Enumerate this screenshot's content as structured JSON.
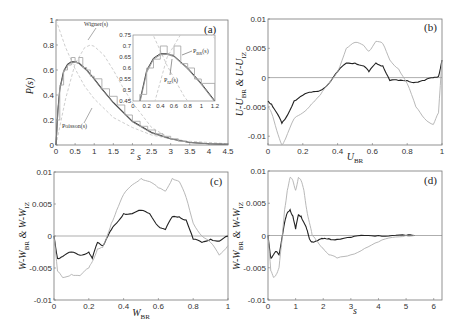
{
  "chart_data": [
    {
      "id": "a",
      "type": "line",
      "panel_label": "(a)",
      "xlabel": "s",
      "ylabel": "P(s)",
      "xlim": [
        0,
        4.5
      ],
      "ylim": [
        0,
        1
      ],
      "xticks": [
        "0",
        "0.5",
        "1",
        "1.5",
        "2",
        "2.5",
        "3",
        "3.5",
        "4",
        "4.5"
      ],
      "yticks": [
        "0",
        "0.2",
        "0.4",
        "0.6",
        "0.8",
        "1"
      ],
      "grid": false,
      "annotations": [
        "Wigner(s)",
        "Poisson(s)"
      ],
      "series": [
        {
          "name": "Poisson(s)",
          "color": "#c8c8c8",
          "style": "dashed",
          "x": [
            0,
            0.25,
            0.5,
            0.75,
            1,
            1.5,
            2,
            2.5,
            3,
            3.5,
            4,
            4.5
          ],
          "y": [
            1,
            0.78,
            0.61,
            0.47,
            0.37,
            0.22,
            0.14,
            0.08,
            0.05,
            0.03,
            0.02,
            0.01
          ]
        },
        {
          "name": "Wigner(s)",
          "color": "#c8c8c8",
          "style": "dashed",
          "x": [
            0,
            0.25,
            0.5,
            0.75,
            0.9,
            1,
            1.25,
            1.5,
            1.75,
            2,
            2.5,
            3
          ],
          "y": [
            0,
            0.37,
            0.65,
            0.78,
            0.8,
            0.79,
            0.72,
            0.6,
            0.46,
            0.34,
            0.14,
            0.05
          ]
        },
        {
          "name": "P_BR(s)",
          "color": "#333333",
          "style": "solid",
          "x": [
            0,
            0.05,
            0.1,
            0.2,
            0.3,
            0.4,
            0.5,
            0.6,
            0.8,
            1,
            1.2,
            1.5,
            2,
            2.5,
            3,
            3.5,
            4,
            4.5
          ],
          "y": [
            0,
            0.28,
            0.45,
            0.59,
            0.645,
            0.665,
            0.665,
            0.655,
            0.6,
            0.53,
            0.45,
            0.34,
            0.19,
            0.1,
            0.05,
            0.02,
            0.01,
            0.005
          ]
        },
        {
          "name": "P_IZ(s)",
          "color": "#888888",
          "style": "solid",
          "x": [
            0,
            0.05,
            0.1,
            0.2,
            0.3,
            0.4,
            0.5,
            0.6,
            0.8,
            1,
            1.2,
            1.5,
            2,
            2.5,
            3,
            3.5,
            4,
            4.5
          ],
          "y": [
            0,
            0.27,
            0.44,
            0.58,
            0.64,
            0.66,
            0.662,
            0.652,
            0.595,
            0.525,
            0.445,
            0.335,
            0.185,
            0.095,
            0.048,
            0.02,
            0.01,
            0.004
          ]
        },
        {
          "name": "histogram",
          "color": "#aaaaaa",
          "style": "steps",
          "x": [
            0,
            0.1,
            0.2,
            0.3,
            0.4,
            0.5,
            0.6,
            0.7,
            0.8,
            0.9,
            1,
            1.2,
            1.4,
            1.6,
            1.8,
            2,
            2.2,
            2.4,
            2.6,
            2.8,
            3,
            3.2,
            3.4
          ],
          "y": [
            0.2,
            0.48,
            0.6,
            0.64,
            0.7,
            0.66,
            0.7,
            0.62,
            0.6,
            0.55,
            0.53,
            0.45,
            0.39,
            0.32,
            0.24,
            0.19,
            0.15,
            0.12,
            0.09,
            0.07,
            0.05,
            0.03,
            0.02
          ]
        }
      ],
      "inset": {
        "xlim": [
          0,
          1.2
        ],
        "ylim": [
          0.45,
          0.75
        ],
        "xticks": [
          "0",
          "0.2",
          "0.4",
          "0.6",
          "0.8",
          "1",
          "1.2"
        ],
        "yticks": [
          "0.45",
          "0.5",
          "0.55",
          "0.6",
          "0.65",
          "0.7",
          "0.75"
        ],
        "annotations": [
          "P_BR(s)",
          "P_IZ(s)"
        ]
      }
    },
    {
      "id": "b",
      "type": "line",
      "panel_label": "(b)",
      "xlabel": "U_BR",
      "ylabel": "U-U_BR & U-U_IZ",
      "xlim": [
        0,
        1
      ],
      "ylim": [
        -0.0115,
        0.01
      ],
      "xticks": [
        "0",
        "0.2",
        "0.4",
        "0.6",
        "0.8",
        "1"
      ],
      "yticks": [
        "-0.01",
        "-0.005",
        "0",
        "0.005",
        "0.01"
      ],
      "grid": false,
      "series": [
        {
          "name": "U-U_BR",
          "color": "#222222",
          "x": [
            0,
            0.02,
            0.05,
            0.08,
            0.1,
            0.15,
            0.2,
            0.25,
            0.3,
            0.35,
            0.4,
            0.45,
            0.5,
            0.55,
            0.58,
            0.62,
            0.66,
            0.7,
            0.75,
            0.8,
            0.85,
            0.9,
            0.95,
            0.98,
            1
          ],
          "y": [
            -0.004,
            -0.0045,
            -0.006,
            -0.0078,
            -0.007,
            -0.004,
            -0.003,
            -0.0025,
            -0.0022,
            -0.001,
            0.001,
            0.0025,
            0.0025,
            0.002,
            0.001,
            0.0025,
            0.002,
            -0.0005,
            -0.0005,
            -0.0005,
            -0.0008,
            -0.0005,
            0,
            0.0002,
            0.003
          ]
        },
        {
          "name": "U-U_IZ",
          "color": "#b0b0b0",
          "x": [
            0,
            0.02,
            0.05,
            0.08,
            0.1,
            0.15,
            0.2,
            0.25,
            0.3,
            0.35,
            0.4,
            0.45,
            0.5,
            0.55,
            0.58,
            0.62,
            0.66,
            0.7,
            0.75,
            0.8,
            0.85,
            0.9,
            0.95,
            0.98,
            1
          ],
          "y": [
            -0.005,
            -0.006,
            -0.009,
            -0.0115,
            -0.0105,
            -0.007,
            -0.006,
            -0.0045,
            -0.003,
            -0.001,
            0.001,
            0.005,
            0.006,
            0.0055,
            0.0045,
            0.0062,
            0.0058,
            0.003,
            0.0015,
            -0.001,
            -0.005,
            -0.007,
            -0.008,
            -0.006,
            0.003
          ]
        }
      ]
    },
    {
      "id": "c",
      "type": "line",
      "panel_label": "(c)",
      "xlabel": "W_BR",
      "ylabel": "W-W_BR & W-W_IZ",
      "xlim": [
        0,
        1
      ],
      "ylim": [
        -0.01,
        0.01
      ],
      "xticks": [
        "0",
        "0.2",
        "0.4",
        "0.6",
        "0.8",
        "1"
      ],
      "yticks": [
        "-0.01",
        "-0.005",
        "0",
        "0.005",
        "0.01"
      ],
      "grid": false,
      "series": [
        {
          "name": "W-W_BR",
          "color": "#222222",
          "x": [
            0,
            0.02,
            0.05,
            0.1,
            0.15,
            0.2,
            0.22,
            0.25,
            0.28,
            0.3,
            0.33,
            0.36,
            0.4,
            0.45,
            0.5,
            0.55,
            0.6,
            0.64,
            0.68,
            0.72,
            0.76,
            0.8,
            0.85,
            0.9,
            0.95,
            1
          ],
          "y": [
            0,
            -0.0035,
            -0.0032,
            -0.0025,
            -0.003,
            -0.0025,
            -0.0035,
            -0.001,
            -0.0015,
            -0.0005,
            0.001,
            0.002,
            0.0035,
            0.0035,
            0.004,
            0.0035,
            0.0015,
            0.001,
            0.003,
            0.003,
            0.0025,
            -0.0005,
            -0.001,
            -0.0005,
            -0.0008,
            0
          ]
        },
        {
          "name": "W-W_IZ",
          "color": "#b0b0b0",
          "x": [
            0,
            0.02,
            0.05,
            0.1,
            0.15,
            0.2,
            0.22,
            0.25,
            0.28,
            0.3,
            0.33,
            0.36,
            0.4,
            0.45,
            0.5,
            0.55,
            0.6,
            0.64,
            0.68,
            0.72,
            0.76,
            0.8,
            0.85,
            0.9,
            0.95,
            1
          ],
          "y": [
            0,
            -0.0055,
            -0.0065,
            -0.006,
            -0.0062,
            -0.005,
            -0.004,
            -0.002,
            -0.0018,
            -0.0005,
            0.002,
            0.004,
            0.0065,
            0.008,
            0.009,
            0.0085,
            0.0075,
            0.007,
            0.009,
            0.0085,
            0.006,
            0.002,
            0,
            -0.001,
            -0.003,
            -0.0015
          ]
        }
      ]
    },
    {
      "id": "d",
      "type": "line",
      "panel_label": "(d)",
      "xlabel": "s",
      "ylabel": "W-W_BR & W-W_IZ",
      "xlim": [
        0,
        6.3
      ],
      "ylim": [
        -0.01,
        0.01
      ],
      "xticks": [
        "0",
        "1",
        "2",
        "3",
        "4",
        "5",
        "6"
      ],
      "yticks": [
        "-0.01",
        "-0.005",
        "0",
        "0.005",
        "0.01"
      ],
      "grid": false,
      "series": [
        {
          "name": "W-W_BR",
          "color": "#222222",
          "x": [
            0,
            0.1,
            0.2,
            0.3,
            0.4,
            0.5,
            0.6,
            0.7,
            0.8,
            0.9,
            1,
            1.1,
            1.2,
            1.3,
            1.4,
            1.5,
            1.6,
            1.8,
            2,
            2.2,
            2.5,
            3,
            3.5,
            4,
            4.5,
            5,
            5.3
          ],
          "y": [
            0,
            -0.0035,
            -0.003,
            -0.0025,
            -0.003,
            -0.0005,
            0.002,
            0.0035,
            0.004,
            0.003,
            0.001,
            0.0032,
            0.003,
            0.002,
            0.001,
            -0.0005,
            -0.001,
            -0.0008,
            -0.0005,
            -0.0005,
            -0.0006,
            -0.0003,
            0,
            0,
            0,
            0,
            0
          ]
        },
        {
          "name": "W-W_IZ",
          "color": "#b0b0b0",
          "x": [
            0,
            0.1,
            0.2,
            0.3,
            0.4,
            0.5,
            0.6,
            0.7,
            0.8,
            0.9,
            1,
            1.1,
            1.2,
            1.3,
            1.4,
            1.5,
            1.6,
            1.8,
            2,
            2.2,
            2.5,
            3,
            3.5,
            4,
            4.5,
            5,
            5.3
          ],
          "y": [
            0,
            -0.0055,
            -0.0065,
            -0.006,
            -0.005,
            -0.001,
            0.004,
            0.007,
            0.009,
            0.0085,
            0.007,
            0.009,
            0.0085,
            0.007,
            0.004,
            0.002,
            0,
            -0.001,
            -0.002,
            -0.003,
            -0.0035,
            -0.003,
            -0.002,
            -0.001,
            -0.0003,
            0,
            0
          ]
        }
      ]
    }
  ],
  "labels": {
    "a": {
      "panel": "(a)",
      "xlabel": "s",
      "ylabel": "P(s)",
      "wigner": "Wigner(s)",
      "poisson": "Poisson(s)",
      "pbr_main": "P",
      "pbr_sub": "BR",
      "pbr_arg": "(s)",
      "piz_main": "P",
      "piz_sub": "IZ",
      "piz_arg": "(s)"
    },
    "b": {
      "panel": "(b)",
      "xlabel_main": "U",
      "xlabel_sub": "BR",
      "ylabel_a": "U-U",
      "ylabel_sub1": "BR",
      "ylabel_mid": " & U-U",
      "ylabel_sub2": "IZ"
    },
    "c": {
      "panel": "(c)",
      "xlabel_main": "W",
      "xlabel_sub": "BR",
      "ylabel_a": "W-W",
      "ylabel_sub1": "BR",
      "ylabel_mid": " & W-W",
      "ylabel_sub2": "IZ"
    },
    "d": {
      "panel": "(d)",
      "xlabel": "s",
      "ylabel_a": "W-W",
      "ylabel_sub1": "BR",
      "ylabel_mid": " & W-W",
      "ylabel_sub2": "IZ"
    }
  }
}
